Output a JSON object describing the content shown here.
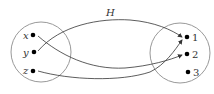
{
  "title": "H",
  "domain_set": {
    "elements": [
      "x",
      "y",
      "z"
    ]
  },
  "codomain_set": {
    "elements": [
      "1",
      "2",
      "3"
    ]
  },
  "mapping": [
    {
      "from": "x",
      "to": "2"
    },
    {
      "from": "y",
      "to": "1"
    },
    {
      "from": "z",
      "to": "1"
    }
  ],
  "colors": {
    "circle": "#999999",
    "arrow": "#333333",
    "dot": "#000000"
  }
}
